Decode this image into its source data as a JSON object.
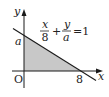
{
  "diagram": {
    "type": "coordinate-graph",
    "axes": {
      "x_label": "x",
      "y_label": "y",
      "origin_label": "O"
    },
    "intercepts": {
      "x_intercept_label": "8",
      "y_intercept_label": "a"
    },
    "equation": {
      "term1_num": "x",
      "term1_den": "8",
      "plus": "+",
      "term2_num": "y",
      "term2_den": "a",
      "rhs": "=1"
    },
    "shaded_region": "triangle bounded by axes and line",
    "colors": {
      "line": "#1a1a1a",
      "shade": "#c8c8c8",
      "axis": "#1a1a1a"
    }
  }
}
